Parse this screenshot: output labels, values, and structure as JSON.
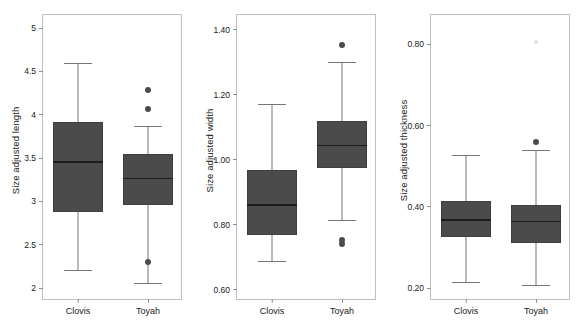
{
  "figure": {
    "background": "#ffffff",
    "box_fill": "#4b4b4b",
    "line_color": "#767676",
    "frame_color": "#bfbfbf"
  },
  "chart_data": [
    {
      "type": "box",
      "title": "",
      "xlabel": "",
      "ylabel": "Size adjusted length",
      "ylim": [
        1.85,
        5.15
      ],
      "yticks": [
        2,
        2.5,
        3,
        3.5,
        4,
        4.5,
        5
      ],
      "ytick_labels": [
        "2",
        "2.5",
        "3",
        "3.5",
        "4",
        "4.5",
        "5"
      ],
      "categories": [
        "Clovis",
        "Toyah"
      ],
      "grid": false,
      "legend": "none",
      "boxes": [
        {
          "name": "Clovis",
          "whisker_low": 2.21,
          "q1": 2.88,
          "median": 3.46,
          "q3": 3.91,
          "whisker_high": 4.6,
          "outliers": []
        },
        {
          "name": "Toyah",
          "whisker_low": 2.06,
          "q1": 2.96,
          "median": 3.27,
          "q3": 3.55,
          "whisker_high": 3.87,
          "outliers": [
            4.29,
            4.06,
            2.3
          ]
        }
      ]
    },
    {
      "type": "box",
      "title": "",
      "xlabel": "",
      "ylabel": "Size adjusted width",
      "ylim": [
        0.565,
        1.445
      ],
      "yticks": [
        0.6,
        0.8,
        1.0,
        1.2,
        1.4
      ],
      "ytick_labels": [
        "0.60",
        "0.80",
        "1.00",
        "1.20",
        "1.40"
      ],
      "categories": [
        "Clovis",
        "Toyah"
      ],
      "grid": false,
      "legend": "none",
      "boxes": [
        {
          "name": "Clovis",
          "whisker_low": 0.688,
          "q1": 0.768,
          "median": 0.862,
          "q3": 0.968,
          "whisker_high": 1.172,
          "outliers": []
        },
        {
          "name": "Toyah",
          "whisker_low": 0.815,
          "q1": 0.973,
          "median": 1.046,
          "q3": 1.119,
          "whisker_high": 1.3,
          "outliers": [
            1.352,
            0.752,
            0.739
          ]
        }
      ]
    },
    {
      "type": "box",
      "title": "",
      "xlabel": "",
      "ylabel": "Size adjusted thickness",
      "ylim": [
        0.168,
        0.872
      ],
      "yticks": [
        0.2,
        0.4,
        0.6,
        0.8
      ],
      "ytick_labels": [
        "0.20",
        "0.40",
        "0.60",
        "0.80"
      ],
      "categories": [
        "Clovis",
        "Toyah"
      ],
      "grid": false,
      "legend": "none",
      "boxes": [
        {
          "name": "Clovis",
          "whisker_low": 0.214,
          "q1": 0.325,
          "median": 0.369,
          "q3": 0.414,
          "whisker_high": 0.528,
          "outliers": []
        },
        {
          "name": "Toyah",
          "whisker_low": 0.208,
          "q1": 0.31,
          "median": 0.366,
          "q3": 0.404,
          "whisker_high": 0.54,
          "outliers": [
            0.56
          ],
          "marks": [
            {
              "glyph": "*",
              "value": 0.8
            }
          ]
        }
      ]
    }
  ]
}
